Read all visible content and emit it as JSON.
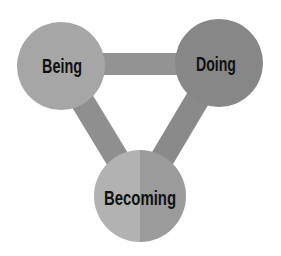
{
  "diagram": {
    "type": "triangle-venn",
    "nodes": [
      {
        "id": "being",
        "label": "Being",
        "cx": 61,
        "cy": 66,
        "r": 44,
        "color": "#a6a6a6"
      },
      {
        "id": "doing",
        "label": "Doing",
        "cx": 219,
        "cy": 63,
        "r": 44,
        "color": "#878787"
      },
      {
        "id": "becoming",
        "label": "Becoming",
        "cx": 140,
        "cy": 196,
        "r": 46,
        "color_left": "#b2b2b2",
        "color_right": "#9b9b9b"
      }
    ],
    "connectors": [
      {
        "from": "being",
        "to": "doing",
        "color": "#939393"
      },
      {
        "from": "being",
        "to": "becoming",
        "color": "#8f8f8f"
      },
      {
        "from": "doing",
        "to": "becoming",
        "color": "#8a8a8a"
      }
    ]
  },
  "labels": {
    "being": "Being",
    "doing": "Doing",
    "becoming": "Becoming"
  }
}
